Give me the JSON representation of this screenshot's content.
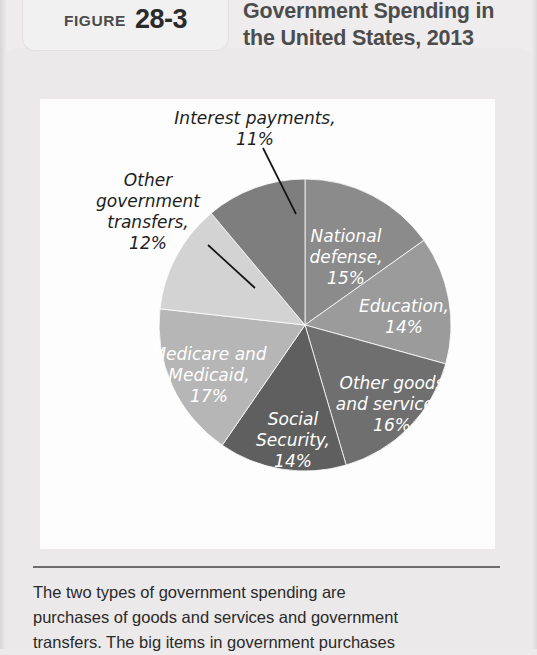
{
  "figure": {
    "label_word": "FIGURE",
    "number": "28-3",
    "title_line1": "Government Spending in",
    "title_line2": "the United States, 2013"
  },
  "caption": {
    "line1": "The two types of government spending are",
    "line2": "purchases of goods and services and government",
    "line3": "transfers. The big items in government purchases"
  },
  "colors": {
    "page_background": "#eeecec",
    "panel_background": "#ebe9e9",
    "chart_background": "#fdfdfd",
    "tab_background": "#f2f1f1",
    "title_text": "#4c4c4c",
    "caption_text": "#2a2a2a",
    "rule": "#6d6d6d",
    "inside_label_text": "#ffffff",
    "outside_label_text": "#1d1d1d",
    "leader_line": "#141414"
  },
  "chart_data": {
    "type": "pie",
    "title": "Government Spending in the United States, 2013",
    "xlabel": "",
    "ylabel": "",
    "units": "percent of total government spending",
    "start_angle_deg": 0,
    "direction": "clockwise",
    "legend": "none",
    "grid": false,
    "center": {
      "x": 305,
      "y": 325
    },
    "radius": 146,
    "categories": [
      "National defense",
      "Education",
      "Other goods and services",
      "Social Security",
      "Medicare and Medicaid",
      "Other government transfers",
      "Interest payments"
    ],
    "values": [
      15,
      14,
      16,
      14,
      17,
      12,
      11
    ],
    "slices": [
      {
        "name": "National defense",
        "value": 15,
        "label_line1": "National",
        "label_line2": "defense,",
        "label_line3": "15%",
        "color": "#8b8b8b",
        "label_placement": "inside",
        "label_x": 346,
        "label_y": 242
      },
      {
        "name": "Education",
        "value": 14,
        "label_line1": "Education,",
        "label_line2": "14%",
        "label_line3": "",
        "color": "#9b9b9b",
        "label_placement": "inside",
        "label_x": 404,
        "label_y": 312
      },
      {
        "name": "Other goods and services",
        "value": 16,
        "label_line1": "Other goods",
        "label_line2": "and services,",
        "label_line3": "16%",
        "color": "#6f6f6f",
        "label_placement": "inside",
        "label_x": 392,
        "label_y": 389
      },
      {
        "name": "Social Security",
        "value": 14,
        "label_line1": "Social",
        "label_line2": "Security,",
        "label_line3": "14%",
        "color": "#5f5f5f",
        "label_placement": "inside",
        "label_x": 293,
        "label_y": 425
      },
      {
        "name": "Medicare and Medicaid",
        "value": 17,
        "label_line1": "Medicare and",
        "label_line2": "Medicaid,",
        "label_line3": "17%",
        "color": "#b6b6b6",
        "label_placement": "inside",
        "label_x": 209,
        "label_y": 360
      },
      {
        "name": "Other government transfers",
        "value": 12,
        "label_line1": "Other",
        "label_line2": "government",
        "label_line3": "transfers,",
        "label_line4": "12%",
        "color": "#d3d3d3",
        "label_placement": "outside-left",
        "label_x": 148,
        "label_y": 186
      },
      {
        "name": "Interest payments",
        "value": 11,
        "label_line1": "Interest payments,",
        "label_line2": "11%",
        "label_line3": "",
        "color": "#7e7e7e",
        "label_placement": "outside-top",
        "label_x": 255,
        "label_y": 124
      }
    ]
  }
}
